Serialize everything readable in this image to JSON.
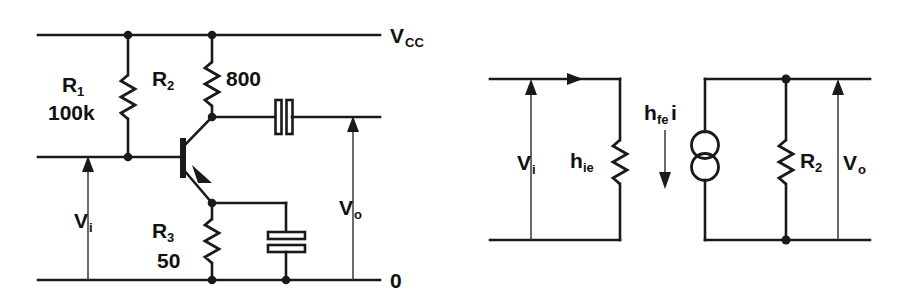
{
  "figure": {
    "ink_color": "#1a1a1a",
    "background_color": "#ffffff"
  },
  "left_circuit": {
    "name": "common-emitter-amplifier",
    "rails": {
      "supply_label": "V",
      "supply_sub": "CC",
      "ground_label": "0"
    },
    "components": {
      "r1": {
        "ref": "R",
        "sub": "1",
        "value": "100k"
      },
      "r2": {
        "ref": "R",
        "sub": "2",
        "value": "800"
      },
      "r3": {
        "ref": "R",
        "sub": "3",
        "value": "50"
      },
      "transistor": {
        "type": "npn-bjt"
      },
      "coupling_capacitor": {
        "type": "capacitor",
        "orientation": "vertical-plates"
      },
      "bypass_capacitor": {
        "type": "capacitor",
        "orientation": "horizontal-plates"
      }
    },
    "signals": {
      "input": {
        "label": "V",
        "sub": "i"
      },
      "output": {
        "label": "V",
        "sub": "o"
      }
    }
  },
  "right_circuit": {
    "name": "small-signal-h-parameter-equivalent",
    "components": {
      "hie": {
        "ref": "h",
        "sub": "ie",
        "type": "resistor"
      },
      "r2": {
        "ref": "R",
        "sub": "2",
        "type": "resistor"
      },
      "current_source": {
        "label": "h",
        "sub": "fe",
        "suffix": "i",
        "type": "dependent-current-source"
      }
    },
    "signals": {
      "input": {
        "label": "V",
        "sub": "i"
      },
      "output": {
        "label": "V",
        "sub": "o"
      },
      "input_current": {
        "direction": "right"
      },
      "source_current": {
        "direction": "down"
      }
    }
  }
}
